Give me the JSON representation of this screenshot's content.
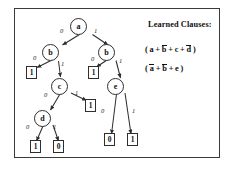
{
  "figure": {
    "type": "binary-decision-tree",
    "border_color": "#3a3a3a",
    "background": "#ffffff",
    "ink_color": "#2e2e2e"
  },
  "tree": {
    "nodes": [
      {
        "id": "a",
        "label": "a",
        "x": 78,
        "y": 18
      },
      {
        "id": "b1",
        "label": "b",
        "x": 50,
        "y": 44
      },
      {
        "id": "b2",
        "label": "b",
        "x": 106,
        "y": 44
      },
      {
        "id": "c",
        "label": "c",
        "x": 59,
        "y": 78
      },
      {
        "id": "e",
        "label": "e",
        "x": 115,
        "y": 78
      },
      {
        "id": "d",
        "label": "d",
        "x": 42,
        "y": 110
      }
    ],
    "leaves": [
      {
        "id": "L1",
        "value": "1",
        "x": 26,
        "y": 66
      },
      {
        "id": "L2",
        "value": "1",
        "x": 85,
        "y": 99
      },
      {
        "id": "L3",
        "value": "1",
        "x": 30,
        "y": 140
      },
      {
        "id": "L4",
        "value": "0",
        "x": 53,
        "y": 140
      },
      {
        "id": "L5",
        "value": "1",
        "x": 88,
        "y": 66
      },
      {
        "id": "L6",
        "value": "0",
        "x": 104,
        "y": 133
      },
      {
        "id": "L7",
        "value": "1",
        "x": 127,
        "y": 133
      }
    ],
    "edges": [
      {
        "from": "a",
        "to": "b1",
        "label": "0",
        "lx": 60,
        "ly": 28
      },
      {
        "from": "a",
        "to": "b2",
        "label": "1",
        "lx": 94,
        "ly": 28
      },
      {
        "from": "b1",
        "to": "L1",
        "label": "0",
        "lx": 33,
        "ly": 55
      },
      {
        "from": "b1",
        "to": "c",
        "label": "1",
        "lx": 60,
        "ly": 60
      },
      {
        "from": "b2",
        "to": "L5",
        "label": "0",
        "lx": 92,
        "ly": 56
      },
      {
        "from": "b2",
        "to": "e",
        "label": "1",
        "lx": 118,
        "ly": 58
      },
      {
        "from": "c",
        "to": "d",
        "label": "0",
        "lx": 44,
        "ly": 92
      },
      {
        "from": "c",
        "to": "L2",
        "label": "1",
        "lx": 76,
        "ly": 90
      },
      {
        "from": "e",
        "to": "L6",
        "label": "0",
        "lx": 102,
        "ly": 110
      },
      {
        "from": "e",
        "to": "L7",
        "label": "1",
        "lx": 131,
        "ly": 110
      },
      {
        "from": "d",
        "to": "L3",
        "label": "0",
        "lx": 27,
        "ly": 124
      },
      {
        "from": "d",
        "to": "L4",
        "label": "1",
        "lx": 53,
        "ly": 124
      }
    ]
  },
  "legend": {
    "title": "Learned Clauses:",
    "clauses": [
      {
        "id": "clause-1",
        "text": "( a + b + c + d )",
        "parts": [
          {
            "t": "( a + ",
            "bar": false
          },
          {
            "t": "b",
            "bar": true
          },
          {
            "t": " + c + ",
            "bar": false
          },
          {
            "t": "d",
            "bar": true
          },
          {
            "t": " )",
            "bar": false
          }
        ]
      },
      {
        "id": "clause-2",
        "text": "( a + b + e )",
        "parts": [
          {
            "t": "( ",
            "bar": false
          },
          {
            "t": "a",
            "bar": true
          },
          {
            "t": " + ",
            "bar": false
          },
          {
            "t": "b",
            "bar": true
          },
          {
            "t": " + e )",
            "bar": false
          }
        ]
      }
    ]
  }
}
